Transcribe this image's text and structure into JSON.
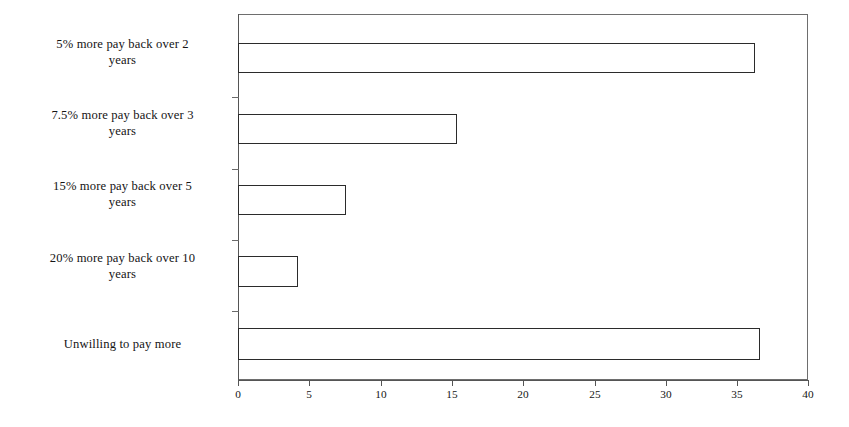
{
  "chart_data": {
    "type": "bar",
    "orientation": "horizontal",
    "title": "",
    "subtitle": "",
    "xlabel": "",
    "ylabel": "",
    "categories": [
      "5% more pay back over 2 years",
      "7.5% more pay back over 3 years",
      "15% more pay back over 5 years",
      "20% more pay back over 10 years",
      "Unwilling to pay more"
    ],
    "values": [
      36.3,
      15.4,
      7.6,
      4.2,
      36.6
    ],
    "xlim": [
      0,
      40
    ],
    "xticks": [
      0,
      5,
      10,
      15,
      20,
      25,
      30,
      35,
      40
    ],
    "xtick_labels": [
      "0",
      "5",
      "10",
      "15",
      "20",
      "25",
      "30",
      "35",
      "40"
    ],
    "grid": false,
    "legend": null,
    "bar_fill_color": "#ffffff",
    "bar_border_color": "#2b2b2b",
    "axis_color": "#555555",
    "background_color": "#ffffff"
  },
  "axis": {
    "left_px": 238,
    "right_px": 808,
    "top_px": 14,
    "bottom_px": 380
  },
  "bars": [
    {
      "label": "5% more pay back over 2 years",
      "value": 36.3,
      "top": 43,
      "height": 30,
      "label_top": 36,
      "label_lines": "5% more pay back over 2 years"
    },
    {
      "label": "7.5% more pay back over 3 years",
      "value": 15.4,
      "top": 114,
      "height": 30,
      "label_top": 107,
      "label_lines": "7.5% more pay back over 3 years"
    },
    {
      "label": "15% more pay back over 5 years",
      "value": 7.6,
      "top": 185,
      "height": 30,
      "label_top": 178,
      "label_lines": "15% more pay back over 5 years"
    },
    {
      "label": "20% more pay back over 10 years",
      "value": 4.2,
      "top": 256,
      "height": 31,
      "label_top": 250,
      "label_lines": "20% more pay back over 10 years"
    },
    {
      "label": "Unwilling to pay more",
      "value": 36.6,
      "top": 328,
      "height": 32,
      "label_top": 336,
      "label_lines": "Unwilling to pay more"
    }
  ],
  "category_labels": {
    "l0_line1": "5% more pay back over 2",
    "l0_line2": "years",
    "l1_line1": "7.5% more pay back over 3",
    "l1_line2": "years",
    "l2_line1": "15% more pay back over 5",
    "l2_line2": "years",
    "l3_line1": "20% more pay back over 10",
    "l3_line2": "years",
    "l4_line1": "Unwilling to pay more"
  },
  "xtick_labels": {
    "t0": "0",
    "t1": "5",
    "t2": "10",
    "t3": "15",
    "t4": "20",
    "t5": "25",
    "t6": "30",
    "t7": "35",
    "t8": "40"
  }
}
